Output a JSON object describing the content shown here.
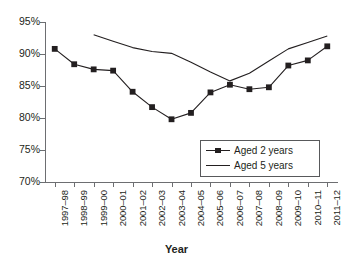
{
  "chart_data": {
    "type": "line",
    "title": "",
    "xlabel": "Year",
    "ylabel": "",
    "ylim": [
      70,
      95
    ],
    "ytick_step": 5,
    "ytick_labels": [
      "95%",
      "90%",
      "85%",
      "80%",
      "75%",
      "70%"
    ],
    "ytick_values": [
      95,
      90,
      85,
      80,
      75,
      70
    ],
    "grid": false,
    "legend_position": "inside-bottom-right",
    "categories": [
      "1997–98",
      "1998–99",
      "1999–00",
      "2000–01",
      "2001–02",
      "2002–03",
      "2003–04",
      "2004–05",
      "2005–06",
      "2006–07",
      "2007–08",
      "2008–09",
      "2009–10",
      "2010–11",
      "2011–12"
    ],
    "series": [
      {
        "name": "Aged 2 years",
        "marker": "square",
        "color": "#231f20",
        "values": [
          90.8,
          88.4,
          87.6,
          87.4,
          84.1,
          81.7,
          79.8,
          80.8,
          84.0,
          85.2,
          84.5,
          84.8,
          88.2,
          89.0,
          91.2
        ]
      },
      {
        "name": "Aged 5 years",
        "marker": "none",
        "color": "#231f20",
        "values": [
          null,
          null,
          93.0,
          92.0,
          91.0,
          90.4,
          90.1,
          88.7,
          87.2,
          85.8,
          87.0,
          88.9,
          90.8,
          91.8,
          92.8
        ]
      }
    ]
  },
  "legend": {
    "items": [
      {
        "label": "Aged 2 years",
        "key": "line-with-square-marker"
      },
      {
        "label": "Aged 5 years",
        "key": "plain-line"
      }
    ]
  },
  "axis": {
    "x_title": "Year"
  }
}
